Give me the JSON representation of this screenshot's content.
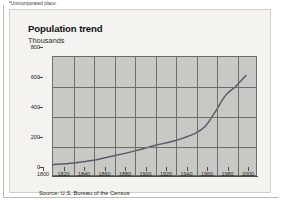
{
  "footnote": "*Unincorporated place.",
  "panel": {
    "title": "Population trend",
    "subtitle": "Thousands",
    "source": "Source: U.S. Bureau of the Census"
  },
  "colors": {
    "plot_background": "#c9c8c4",
    "panel_background": "#f4f3ef",
    "gridline": "#6e6d6a",
    "series_line": "#5b5a6b",
    "text": "#1d1d1b"
  },
  "chart_data": {
    "type": "line",
    "title": "Population trend",
    "subtitle": "Thousands",
    "xlabel": "",
    "ylabel": "Thousands",
    "xlim": [
      1800,
      2000
    ],
    "ylim": [
      0,
      800
    ],
    "xticks": [
      1800,
      1820,
      1840,
      1860,
      1880,
      1900,
      1920,
      1940,
      1960,
      1980,
      2000
    ],
    "yticks": [
      0,
      200,
      400,
      600,
      800
    ],
    "grid": true,
    "legend": "none",
    "source": "Source: U.S. Bureau of the Census",
    "series": [
      {
        "name": "Population",
        "x": [
          1800,
          1820,
          1840,
          1860,
          1880,
          1900,
          1920,
          1940,
          1950,
          1960,
          1970,
          1980,
          1990
        ],
        "values": [
          70,
          82,
          100,
          130,
          162,
          200,
          232,
          282,
          330,
          430,
          540,
          600,
          675
        ]
      }
    ]
  }
}
